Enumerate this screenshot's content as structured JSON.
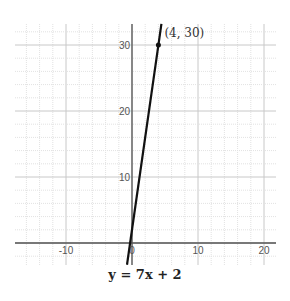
{
  "chart_data": {
    "type": "line",
    "title": "y = 7x + 2",
    "xlabel": "",
    "ylabel": "",
    "xlim": [
      -18,
      22
    ],
    "ylim": [
      -3.3,
      33.2
    ],
    "grid": true,
    "grid_step": 2,
    "x_ticks": [
      -10,
      0,
      10,
      20
    ],
    "x_tick_labels": [
      "-10",
      "0",
      "10",
      "20"
    ],
    "y_ticks": [
      10,
      20,
      30
    ],
    "y_tick_labels": [
      "10",
      "20",
      "30"
    ],
    "series": [
      {
        "name": "y = 7x + 2",
        "slope": 7,
        "intercept": 2,
        "color": "#111111"
      }
    ],
    "points": [
      {
        "x": 4,
        "y": 30,
        "label": "(4, 30)"
      }
    ]
  },
  "equation_label": "y = 7x + 2"
}
